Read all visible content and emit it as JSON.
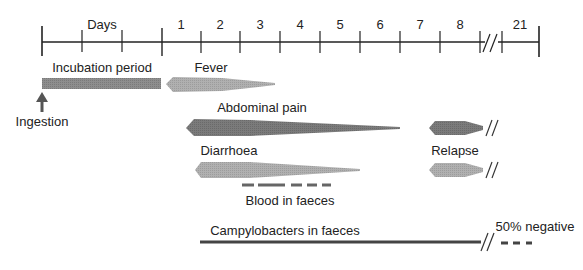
{
  "colors": {
    "axis": "#222222",
    "dark_bar": "#7b7b7b",
    "light_bar": "#a9a9a9",
    "medium_bar": "#8c8c8c",
    "line": "#3a3a3a",
    "blood": "#6e6e6e"
  },
  "axis": {
    "unit_label": "Days",
    "day_labels": [
      "1",
      "2",
      "3",
      "4",
      "5",
      "6",
      "7",
      "8",
      "21"
    ],
    "break_symbol": "//"
  },
  "events": {
    "ingestion": "Ingestion",
    "incubation": "Incubation period",
    "fever": "Fever",
    "abdominal_pain": "Abdominal pain",
    "diarrhoea": "Diarrhoea",
    "relapse": "Relapse",
    "blood": "Blood in faeces",
    "campylobacters": "Campylobacters in faeces",
    "negative": "50% negative"
  }
}
